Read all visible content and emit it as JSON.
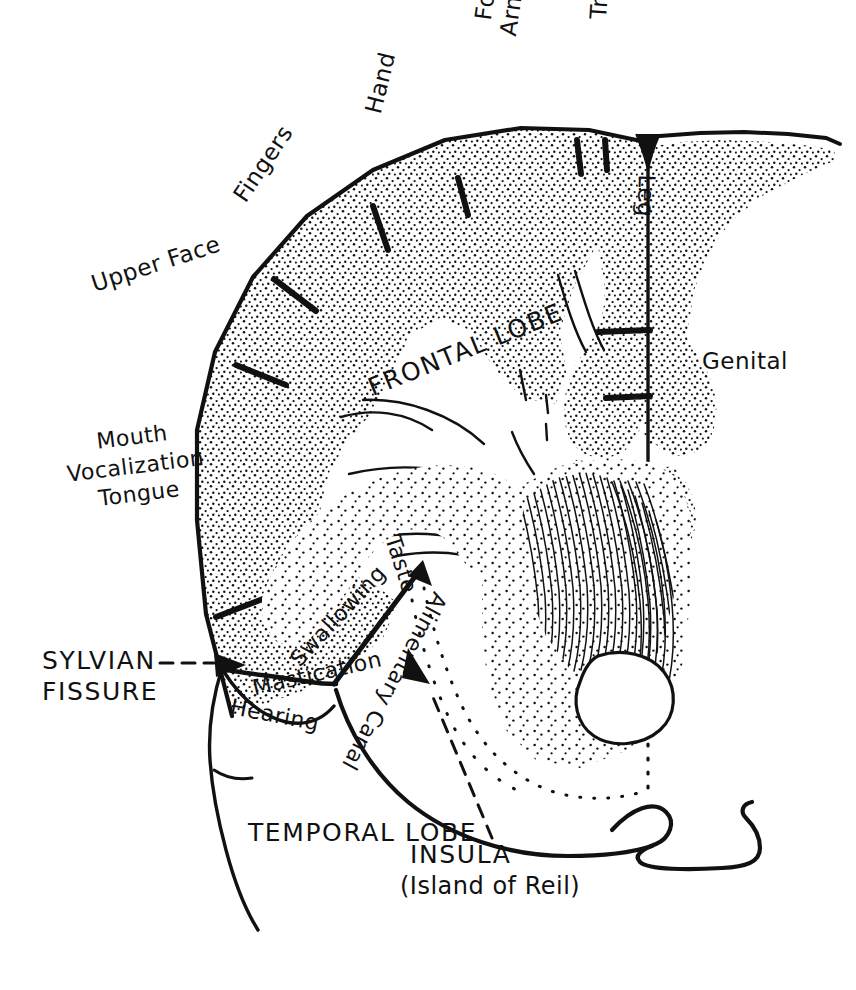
{
  "figure": {
    "type": "anatomical-diagram",
    "background_color": "#ffffff",
    "ink_color": "#111111",
    "width": 856,
    "height": 990
  },
  "labels": {
    "homunculus": [
      {
        "id": "fingers",
        "text": "Fingers"
      },
      {
        "id": "hand",
        "text": "Hand"
      },
      {
        "id": "arm",
        "text": "Arm"
      },
      {
        "id": "forearm",
        "text": "Forearm"
      },
      {
        "id": "trunk",
        "text": "Trunk"
      },
      {
        "id": "leg",
        "text": "Leg"
      },
      {
        "id": "genital",
        "text": "Genital"
      },
      {
        "id": "upper_face",
        "text": "Upper Face"
      }
    ],
    "speech_group": {
      "line1": "Mouth",
      "line2": "Vocalization",
      "line3": "Tongue",
      "combined": "Mouth\nVocalization\nTongue"
    },
    "operculum": [
      {
        "id": "swallowing",
        "text": "Swallowing"
      },
      {
        "id": "taste",
        "text": "Taste"
      },
      {
        "id": "mastication",
        "text": "Mastication"
      },
      {
        "id": "hearing",
        "text": "Hearing"
      },
      {
        "id": "alimentary_canal",
        "text": "Alimentary Canal"
      }
    ],
    "lobes": [
      {
        "id": "frontal_lobe",
        "text": "FRONTAL LOBE"
      },
      {
        "id": "temporal_lobe",
        "text": "TEMPORAL LOBE"
      }
    ],
    "callouts": [
      {
        "id": "sylvian_fissure",
        "line1": "SYLVIAN",
        "line2": "FISSURE",
        "combined": "SYLVIAN\nFISSURE",
        "leader": "dashed-arrow-right"
      },
      {
        "id": "insula",
        "line1": "INSULA",
        "line2": "(Island of Reil)",
        "combined": "INSULA\n(Island of Reil)",
        "leader": "dashed-arrow-up-left"
      }
    ]
  },
  "annotations": {
    "tick_marks_description": "Short heavy tick marks crossing the stippled cortical ribbon mark the boundary between adjacent body-part representations",
    "tick_count": 9,
    "stipple_description": "Fine dot stipple fills the cortical ribbon and the deep grey-matter mass",
    "hatch_description": "Dense fine parallel line hatching fills the lentiform / internal-capsule region"
  }
}
